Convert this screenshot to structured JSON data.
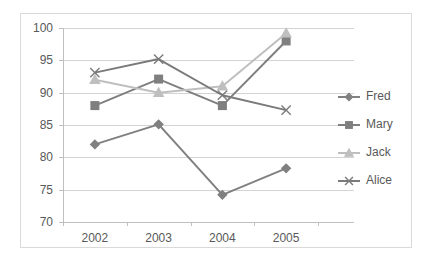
{
  "chart_data": {
    "type": "line",
    "title": "",
    "xlabel": "",
    "ylabel": "",
    "categories": [
      "2002",
      "2003",
      "2004",
      "2005"
    ],
    "ylim": [
      70,
      100
    ],
    "yticks": [
      70,
      75,
      80,
      85,
      90,
      95,
      100
    ],
    "ytick_labels": [
      "70",
      "75",
      "80",
      "85",
      "90",
      "95",
      "100"
    ],
    "grid": true,
    "legend_position": "right",
    "series": [
      {
        "name": "Fred",
        "marker": "diamond",
        "color": "#808080",
        "values": [
          82,
          85.1,
          74.2,
          78.3
        ]
      },
      {
        "name": "Mary",
        "marker": "square",
        "color": "#7f7f7f",
        "values": [
          88,
          92.1,
          88,
          98
        ]
      },
      {
        "name": "Jack",
        "marker": "triangle",
        "color": "#bfbfbf",
        "values": [
          92,
          90,
          91,
          99.2
        ]
      },
      {
        "name": "Alice",
        "marker": "cross",
        "color": "#7a7a7a",
        "values": [
          93.1,
          95.2,
          89.6,
          87.3
        ]
      }
    ]
  },
  "legend": {
    "items": [
      {
        "label": "Fred"
      },
      {
        "label": "Mary"
      },
      {
        "label": "Jack"
      },
      {
        "label": "Alice"
      }
    ]
  },
  "colors": {
    "gridline": "#d4d4d4",
    "axis": "#bfbfbf",
    "text": "#595959",
    "frame": "#d9d9d9",
    "background": "#ffffff"
  }
}
